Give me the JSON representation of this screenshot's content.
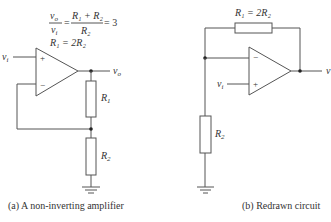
{
  "figure_a": {
    "caption": "(a) A non-inverting amplifier",
    "equation": {
      "lhs_num": "v",
      "lhs_num_sub": "o",
      "lhs_den": "v",
      "lhs_den_sub": "i",
      "rhs_num": "R₁ + R₂",
      "rhs_den": "R₂",
      "result": "= 3",
      "equals": "="
    },
    "relation": "R₁ = 2R₂",
    "input_label": "v",
    "input_sub": "i",
    "output_label": "v",
    "output_sub": "o",
    "plus_sign": "+",
    "minus_sign": "−",
    "r1_label": "R",
    "r1_sub": "1",
    "r2_label": "R",
    "r2_sub": "2"
  },
  "figure_b": {
    "caption": "(b) Redrawn circuit",
    "feedback_label": "R₁ = 2R₂",
    "input_label": "v",
    "input_sub": "i",
    "output_label": "v",
    "plus_sign": "+",
    "minus_sign": "−",
    "r2_label": "R",
    "r2_sub": "2"
  },
  "colors": {
    "wire": "#555555",
    "text": "#333333",
    "background": "#ffffff"
  }
}
